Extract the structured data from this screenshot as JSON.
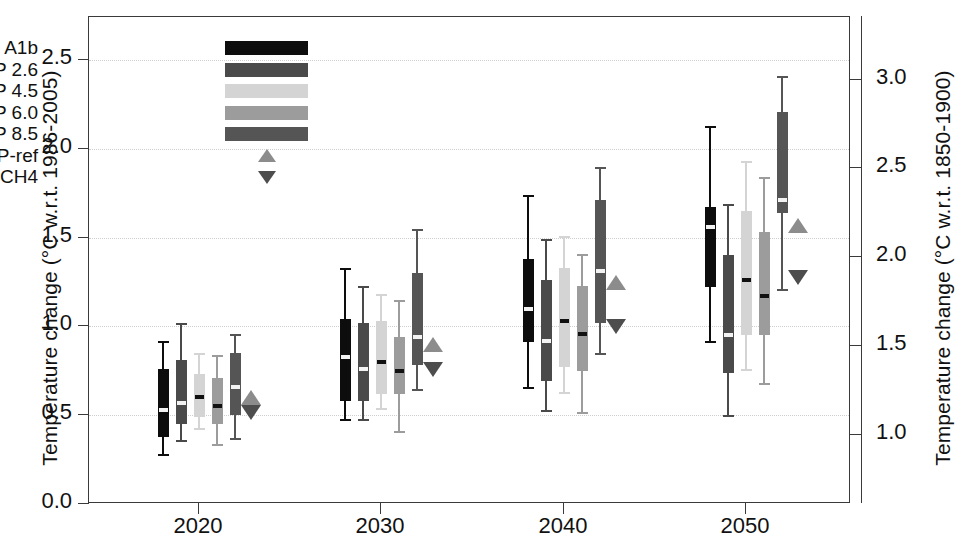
{
  "chart_data": {
    "type": "box",
    "title": "",
    "xlabel": "",
    "ylabel": "Temperature change (°C w.r.t. 1986-2005)",
    "ylabel_right": "Temperature change (°C w.r.t. 1850-1900)",
    "categories": [
      "2020",
      "2030",
      "2040",
      "2050"
    ],
    "xticks": [
      "2020",
      "2030",
      "2040",
      "2050"
    ],
    "yticks_left": [
      "0.0",
      "0.5",
      "1.0",
      "1.5",
      "2.0",
      "2.5"
    ],
    "yticks_left_values": [
      0.0,
      0.5,
      1.0,
      1.5,
      2.0,
      2.5
    ],
    "ylim": [
      0.0,
      2.74
    ],
    "yticks_right": [
      "1.0",
      "1.5",
      "2.0",
      "2.5",
      "3.0"
    ],
    "yticks_right_values": [
      1.0,
      1.5,
      2.0,
      2.5,
      3.0
    ],
    "right_axis_offset": 0.61,
    "grid": "horizontal dotted",
    "legend_position": "upper-left inside",
    "series": [
      {
        "name": "SRES A1b",
        "color": "#0d0d0d"
      },
      {
        "name": "RCP 2.6",
        "color": "#4a4a4a"
      },
      {
        "name": "RCP 4.5",
        "color": "#d4d4d4"
      },
      {
        "name": "RCP 6.0",
        "color": "#9c9c9c"
      },
      {
        "name": "RCP 8.5",
        "color": "#555555"
      }
    ],
    "markers": [
      {
        "name": "UNEP-ref",
        "shape": "triangle-up",
        "color": "#8c8c8c"
      },
      {
        "name": "-CH4",
        "shape": "triangle-down",
        "color": "#4d4d4d"
      }
    ],
    "boxes": [
      {
        "year": "2020",
        "scenario": "SRES A1b",
        "color": "#0d0d0d",
        "whisker_low": 0.28,
        "q1": 0.38,
        "median": 0.53,
        "q3": 0.76,
        "whisker_high": 0.92
      },
      {
        "year": "2020",
        "scenario": "RCP 2.6",
        "color": "#4a4a4a",
        "whisker_low": 0.36,
        "q1": 0.45,
        "median": 0.57,
        "q3": 0.81,
        "whisker_high": 1.02
      },
      {
        "year": "2020",
        "scenario": "RCP 4.5",
        "color": "#d4d4d4",
        "whisker_low": 0.43,
        "q1": 0.49,
        "median": 0.6,
        "q3": 0.73,
        "whisker_high": 0.85
      },
      {
        "year": "2020",
        "scenario": "RCP 6.0",
        "color": "#9c9c9c",
        "whisker_low": 0.34,
        "q1": 0.45,
        "median": 0.55,
        "q3": 0.71,
        "whisker_high": 0.84
      },
      {
        "year": "2020",
        "scenario": "RCP 8.5",
        "color": "#555555",
        "whisker_low": 0.37,
        "q1": 0.5,
        "median": 0.66,
        "q3": 0.85,
        "whisker_high": 0.96
      },
      {
        "year": "2030",
        "scenario": "SRES A1b",
        "color": "#0d0d0d",
        "whisker_low": 0.48,
        "q1": 0.58,
        "median": 0.83,
        "q3": 1.04,
        "whisker_high": 1.33
      },
      {
        "year": "2030",
        "scenario": "RCP 2.6",
        "color": "#4a4a4a",
        "whisker_low": 0.48,
        "q1": 0.58,
        "median": 0.76,
        "q3": 1.02,
        "whisker_high": 1.23
      },
      {
        "year": "2030",
        "scenario": "RCP 4.5",
        "color": "#d4d4d4",
        "whisker_low": 0.54,
        "q1": 0.62,
        "median": 0.8,
        "q3": 1.03,
        "whisker_high": 1.18
      },
      {
        "year": "2030",
        "scenario": "RCP 6.0",
        "color": "#9c9c9c",
        "whisker_low": 0.41,
        "q1": 0.62,
        "median": 0.75,
        "q3": 0.94,
        "whisker_high": 1.15
      },
      {
        "year": "2030",
        "scenario": "RCP 8.5",
        "color": "#555555",
        "whisker_low": 0.65,
        "q1": 0.78,
        "median": 0.94,
        "q3": 1.3,
        "whisker_high": 1.55
      },
      {
        "year": "2040",
        "scenario": "SRES A1b",
        "color": "#0d0d0d",
        "whisker_low": 0.66,
        "q1": 0.91,
        "median": 1.1,
        "q3": 1.38,
        "whisker_high": 1.74
      },
      {
        "year": "2040",
        "scenario": "RCP 2.6",
        "color": "#4a4a4a",
        "whisker_low": 0.53,
        "q1": 0.69,
        "median": 0.92,
        "q3": 1.26,
        "whisker_high": 1.49
      },
      {
        "year": "2040",
        "scenario": "RCP 4.5",
        "color": "#d4d4d4",
        "whisker_low": 0.63,
        "q1": 0.77,
        "median": 1.03,
        "q3": 1.33,
        "whisker_high": 1.51
      },
      {
        "year": "2040",
        "scenario": "RCP 6.0",
        "color": "#9c9c9c",
        "whisker_low": 0.52,
        "q1": 0.75,
        "median": 0.96,
        "q3": 1.23,
        "whisker_high": 1.41
      },
      {
        "year": "2040",
        "scenario": "RCP 8.5",
        "color": "#555555",
        "whisker_low": 0.85,
        "q1": 1.02,
        "median": 1.31,
        "q3": 1.71,
        "whisker_high": 1.9
      },
      {
        "year": "2050",
        "scenario": "SRES A1b",
        "color": "#0d0d0d",
        "whisker_low": 0.92,
        "q1": 1.22,
        "median": 1.56,
        "q3": 1.67,
        "whisker_high": 2.13
      },
      {
        "year": "2050",
        "scenario": "RCP 2.6",
        "color": "#4a4a4a",
        "whisker_low": 0.5,
        "q1": 0.74,
        "median": 0.95,
        "q3": 1.4,
        "whisker_high": 1.69
      },
      {
        "year": "2050",
        "scenario": "RCP 4.5",
        "color": "#d4d4d4",
        "whisker_low": 0.76,
        "q1": 0.95,
        "median": 1.26,
        "q3": 1.65,
        "whisker_high": 1.93
      },
      {
        "year": "2050",
        "scenario": "RCP 6.0",
        "color": "#9c9c9c",
        "whisker_low": 0.68,
        "q1": 0.95,
        "median": 1.17,
        "q3": 1.53,
        "whisker_high": 1.84
      },
      {
        "year": "2050",
        "scenario": "RCP 8.5",
        "color": "#555555",
        "whisker_low": 1.21,
        "q1": 1.64,
        "median": 1.71,
        "q3": 2.21,
        "whisker_high": 2.41
      }
    ],
    "marker_points": [
      {
        "year": "2020",
        "name": "UNEP-ref",
        "shape": "triangle-up",
        "value": 0.6
      },
      {
        "year": "2020",
        "name": "-CH4",
        "shape": "triangle-down",
        "value": 0.52
      },
      {
        "year": "2030",
        "name": "UNEP-ref",
        "shape": "triangle-up",
        "value": 0.9
      },
      {
        "year": "2030",
        "name": "-CH4",
        "shape": "triangle-down",
        "value": 0.76
      },
      {
        "year": "2040",
        "name": "UNEP-ref",
        "shape": "triangle-up",
        "value": 1.25
      },
      {
        "year": "2040",
        "name": "-CH4",
        "shape": "triangle-down",
        "value": 1.0
      },
      {
        "year": "2050",
        "name": "UNEP-ref",
        "shape": "triangle-up",
        "value": 1.57
      },
      {
        "year": "2050",
        "name": "-CH4",
        "shape": "triangle-down",
        "value": 1.28
      }
    ]
  },
  "legend": {
    "rows": [
      {
        "label": "SRES A1b",
        "swatch": "#0d0d0d",
        "kind": "bar"
      },
      {
        "label": "RCP 2.6",
        "swatch": "#4a4a4a",
        "kind": "bar"
      },
      {
        "label": "RCP 4.5",
        "swatch": "#d4d4d4",
        "kind": "bar"
      },
      {
        "label": "RCP 6.0",
        "swatch": "#9c9c9c",
        "kind": "bar"
      },
      {
        "label": "RCP 8.5",
        "swatch": "#555555",
        "kind": "bar"
      },
      {
        "label": "UNEP-ref",
        "swatch": "#8c8c8c",
        "kind": "tri-up"
      },
      {
        "label": "-CH4",
        "swatch": "#4d4d4d",
        "kind": "tri-dn"
      }
    ]
  },
  "axes": {
    "left_title": "Temperature change (°C w.r.t. 1986-2005)",
    "right_title": "Temperature change (°C w.r.t. 1850-1900)"
  }
}
